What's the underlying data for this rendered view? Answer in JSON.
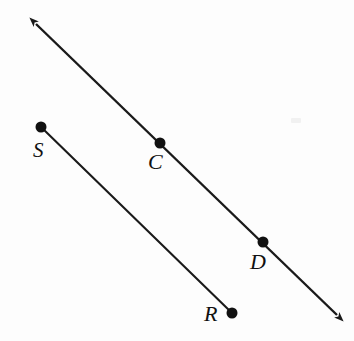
{
  "figure": {
    "background_color": "#fdfdfd",
    "stroke_color": "#1a1a1a",
    "point_color": "#111111",
    "width": 354,
    "height": 341
  },
  "labels": {
    "s": "S",
    "c": "C",
    "d": "D",
    "r": "R"
  },
  "chart_data": {
    "type": "scatter",
    "xlabel": "",
    "ylabel": "",
    "xlim": [
      0,
      354
    ],
    "ylim": [
      0,
      341
    ],
    "grid": false,
    "legend": "none",
    "coordinate_system": "screen pixels, origin top-left",
    "points": [
      {
        "label": "S",
        "x": 41,
        "y": 127,
        "label_x": 40,
        "label_y": 152,
        "marker": "filled-circle",
        "radius": 5.5
      },
      {
        "label": "C",
        "x": 160,
        "y": 143,
        "label_x": 157,
        "label_y": 163,
        "marker": "filled-circle",
        "radius": 5.5
      },
      {
        "label": "D",
        "x": 263,
        "y": 242,
        "label_x": 261,
        "label_y": 263,
        "marker": "filled-circle",
        "radius": 5.5
      },
      {
        "label": "R",
        "x": 232,
        "y": 313,
        "label_x": 214,
        "label_y": 318,
        "marker": "filled-circle",
        "radius": 5.5
      }
    ],
    "lines": [
      {
        "name": "line-CD",
        "kind": "double-arrow-line",
        "through_points": [
          "C",
          "D"
        ],
        "x1": 36,
        "y1": 24,
        "x2": 337,
        "y2": 315,
        "slope": 0.967,
        "arrow_start": true,
        "arrow_end": true,
        "stroke_width": 2.4
      },
      {
        "name": "segment-SR",
        "kind": "segment",
        "through_points": [
          "S",
          "R"
        ],
        "x1": 41,
        "y1": 127,
        "x2": 232,
        "y2": 313,
        "slope": 0.974,
        "arrow_start": false,
        "arrow_end": false,
        "stroke_width": 2.0
      }
    ],
    "annotations": [
      {
        "text": "line CD is parallel to segment SR",
        "visual": "implied by equal slopes"
      }
    ]
  }
}
